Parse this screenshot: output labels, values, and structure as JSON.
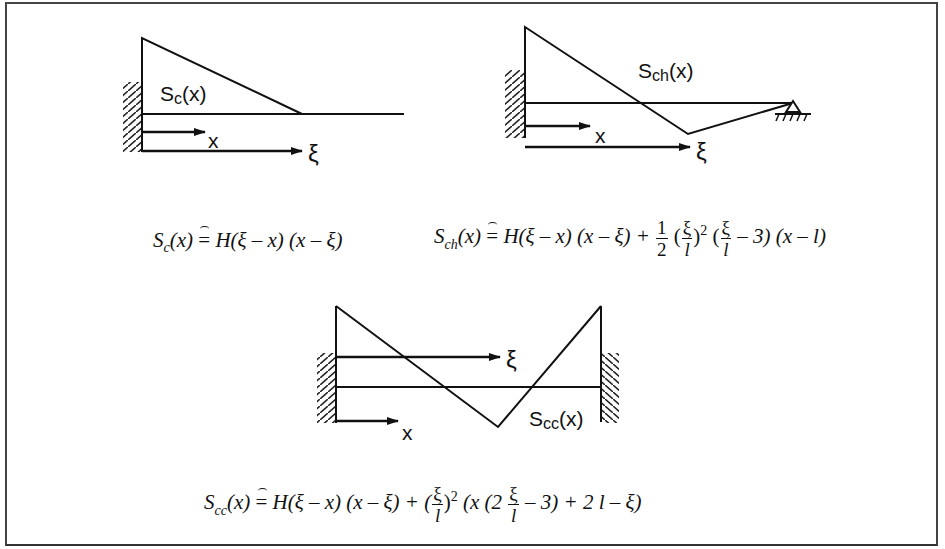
{
  "diagram": {
    "panels": [
      {
        "id": "cantilever",
        "curve_label": "S",
        "curve_sub": "c",
        "curve_arg": "(x)",
        "axis_x_label": "x",
        "axis_xi_label": "ξ"
      },
      {
        "id": "clamped-hinged",
        "curve_label": "S",
        "curve_sub": "ch",
        "curve_arg": "(x)",
        "axis_x_label": "x",
        "axis_xi_label": "ξ"
      },
      {
        "id": "clamped-clamped",
        "curve_label": "S",
        "curve_sub": "cc",
        "curve_arg": "(x)",
        "axis_x_label": "x",
        "axis_xi_label": "ξ"
      }
    ],
    "equations": {
      "sc": {
        "lhs": "S",
        "lhs_sub": "c",
        "lhs_arg": "(x)",
        "op": "=",
        "rhs_a": "H(ξ – x) (x – ξ)"
      },
      "sch": {
        "lhs": "S",
        "lhs_sub": "ch",
        "lhs_arg": "(x)",
        "op": "=",
        "rhs_a": "H(ξ – x) (x – ξ) + ",
        "half_num": "1",
        "half_den": "2",
        "p1_open": "(",
        "xi_num": "ξ",
        "l_den": "l",
        "p1_close": ")",
        "sq": "2",
        "p2_open": " (",
        "xi_num2": "ξ",
        "l_den2": "l",
        "rhs_b": " – 3) (x – l)"
      },
      "scc": {
        "lhs": "S",
        "lhs_sub": "cc",
        "lhs_arg": "(x)",
        "op": "=",
        "rhs_a": "H(ξ – x) (x – ξ) + (",
        "xi_num": "ξ",
        "l_den": "l",
        "p1_close": ")",
        "sq": "2",
        "rhs_b": " (x (2 ",
        "xi_num2": "ξ",
        "l_den2": "l",
        "rhs_c": " – 3) + 2 l – ξ)"
      }
    }
  }
}
